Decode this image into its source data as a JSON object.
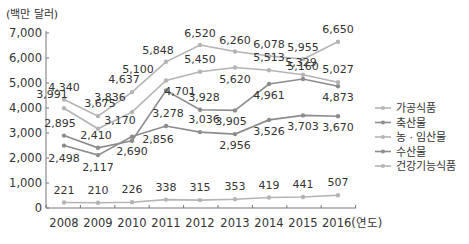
{
  "chart_data": {
    "type": "line",
    "title": "",
    "ylabel": "(백만 달러)",
    "xlabel": "(연도)",
    "x": [
      "2008",
      "2009",
      "2010",
      "2011",
      "2012",
      "2013",
      "2014",
      "2015",
      "2016"
    ],
    "x_tick_labels": [
      "2008",
      "2009",
      "2010",
      "2011",
      "2012",
      "2013",
      "2014",
      "2015",
      "2016(연도)"
    ],
    "y_ticks": [
      "0",
      "1,000",
      "2,000",
      "3,000",
      "4,000",
      "5,000",
      "6,000",
      "7,000"
    ],
    "ylim": [
      0,
      7000
    ],
    "grid": false,
    "legend_position": "right",
    "series": [
      {
        "name": "가공식품",
        "color": "#b4b4b4",
        "values": [
          4340,
          3675,
          4637,
          5848,
          6520,
          6260,
          6078,
          5955,
          6650
        ],
        "labels": [
          "4,340",
          "3,675",
          "4,637",
          "5,848",
          "6,520",
          "6,260",
          "6,078",
          "5,955",
          "6,650"
        ]
      },
      {
        "name": "축산물",
        "color": "#8c8c8c",
        "values": [
          2895,
          2410,
          2690,
          4701,
          3928,
          3905,
          4961,
          5160,
          4873
        ],
        "labels": [
          "2,895",
          "2,410",
          "2,690",
          "4,701",
          "3,928",
          "3,905",
          "4,961",
          "5,160",
          "4,873"
        ]
      },
      {
        "name": "농 · 임산물",
        "color": "#b4b4b4",
        "values": [
          3991,
          3170,
          3836,
          5100,
          5450,
          5620,
          5513,
          5329,
          5027
        ],
        "labels": [
          "3,991",
          "3,170",
          "3,836",
          "5,100",
          "5,450",
          "5,620",
          "5,513",
          "5,329",
          "5,027"
        ]
      },
      {
        "name": "수산물",
        "color": "#8c8c8c",
        "values": [
          2498,
          2117,
          2856,
          3278,
          3036,
          2956,
          3526,
          3703,
          3670
        ],
        "labels": [
          "2,498",
          "2,117",
          "2,856",
          "3,278",
          "3,036",
          "2,956",
          "3,526",
          "3,703",
          "3,670"
        ]
      },
      {
        "name": "건강기능식품",
        "color": "#b4b4b4",
        "values": [
          221,
          210,
          226,
          338,
          315,
          353,
          419,
          441,
          507
        ],
        "labels": [
          "221",
          "210",
          "226",
          "338",
          "315",
          "353",
          "419",
          "441",
          "507"
        ]
      }
    ]
  }
}
